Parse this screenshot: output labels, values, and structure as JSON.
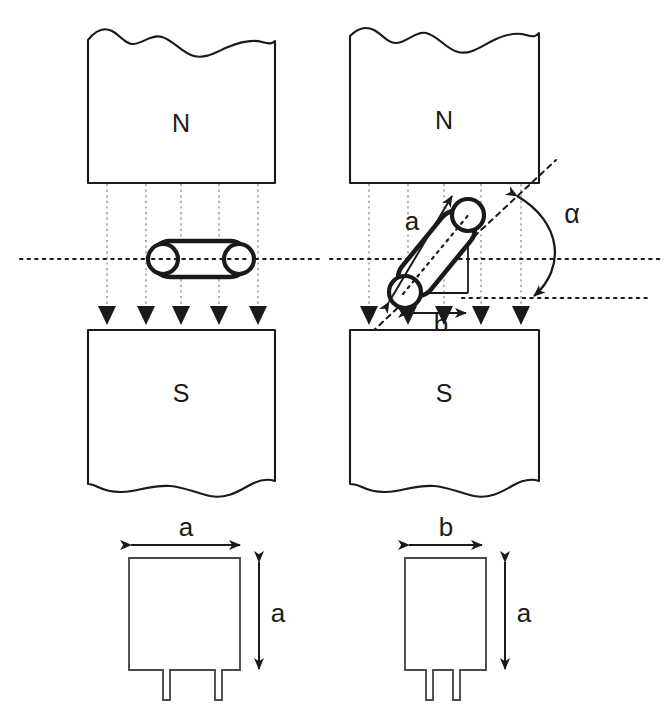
{
  "figure": {
    "width": 668,
    "height": 719,
    "background": "#ffffff",
    "ink_color": "#1a1a1a",
    "fieldline_color": "#9a9a9a"
  },
  "panels": {
    "left": {
      "name": "aligned-configuration",
      "north_label": "N",
      "south_label": "S",
      "field_line_count": 5,
      "specimen_orientation": "horizontal"
    },
    "right": {
      "name": "tilted-configuration",
      "north_label": "N",
      "south_label": "S",
      "field_line_count": 5,
      "specimen_orientation": "tilted",
      "angle_label": "α",
      "length_label": "a",
      "projection_label": "b"
    }
  },
  "bottom_shapes": {
    "left": {
      "name": "square-cross-section",
      "width_label": "a",
      "height_label": "a"
    },
    "right": {
      "name": "rectangular-cross-section",
      "width_label": "b",
      "height_label": "a"
    }
  }
}
